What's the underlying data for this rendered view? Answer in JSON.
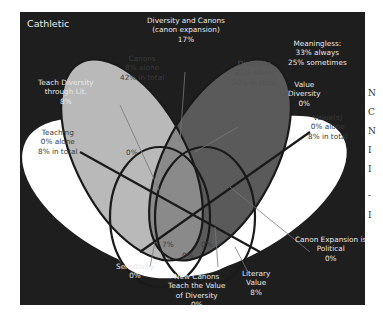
{
  "title": "Cathletic",
  "colors": {
    "background": "#1e1e1e",
    "teaching_value": "#ffffff",
    "canons": "#b9b9b9",
    "diversity": "#5a5a5a",
    "overlap_mid": "#8a8a8a",
    "outline": "#1a1a1a"
  },
  "sets": {
    "canons": {
      "name": "Canons",
      "alone": "8% alone",
      "total": "42% in total"
    },
    "diversity": {
      "name": "Diversity",
      "alone": "25% alone",
      "total": "50% in total"
    },
    "teaching": {
      "name": "Teaching",
      "alone": "0% alone",
      "total": "8% in total"
    },
    "values": {
      "name": "Value(s)",
      "alone": "0% alone",
      "total": "8% in total"
    }
  },
  "intersections": {
    "diversity_canons": {
      "line1": "Diversity and Canons",
      "line2": "(canon expansion)",
      "pct": "17%"
    },
    "meaningless": {
      "line1": "Meaningless:",
      "line2": "33% always",
      "line3": "25% sometimes"
    },
    "teach_diversity": {
      "line1": "Teach Diversity",
      "line2": "through Lit.",
      "pct": "8%"
    },
    "value_diversity": {
      "line1": "Value",
      "line2": "Diversity",
      "pct": "0%"
    },
    "teaching_canons": {
      "pct": "0%"
    },
    "canon_expansion_political": {
      "line1": "Canon Expansion is",
      "line2": "Political",
      "pct": "0%"
    },
    "sensitivity": {
      "line1": "Sensitivity",
      "pct": "0%"
    },
    "literary_value": {
      "line1": "Literary",
      "line2": "Value",
      "pct": "8%"
    },
    "new_canons": {
      "line1": "New Canons",
      "line2": "Teach the Value",
      "line3": "of Diversity",
      "pct": "0%"
    },
    "center_left": {
      "pct": "7%"
    },
    "center_bottom": {
      "pct": "0%"
    },
    "center_right": {
      "pct": "0%"
    }
  },
  "margin_letters": [
    "N",
    "C",
    "N",
    "I",
    "I",
    "-",
    "I"
  ]
}
